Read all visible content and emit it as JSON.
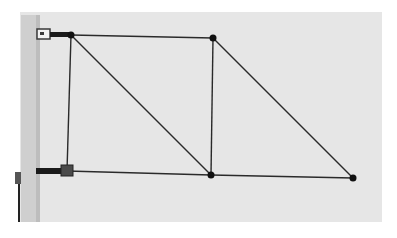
{
  "figure": {
    "colors": {
      "page": "#ffffff",
      "backdrop": "#e6e6e6",
      "post": "#cfcfcf",
      "post_shadow": "#bdbdbd",
      "member": "#2a2a2a",
      "joint": "#111111",
      "bracket": "#3a3a3a"
    },
    "backdrop": {
      "x": 20,
      "y": 12,
      "w": 362,
      "h": 210
    },
    "post": {
      "x": 21,
      "y": 15,
      "w": 19,
      "h": 207
    },
    "joints": [
      {
        "id": "A",
        "x": 71,
        "y": 35
      },
      {
        "id": "B",
        "x": 213,
        "y": 38
      },
      {
        "id": "C",
        "x": 67,
        "y": 171
      },
      {
        "id": "D",
        "x": 211,
        "y": 175
      },
      {
        "id": "E",
        "x": 353,
        "y": 178
      }
    ],
    "members": [
      {
        "from": "A",
        "to": "B"
      },
      {
        "from": "A",
        "to": "C"
      },
      {
        "from": "A",
        "to": "D"
      },
      {
        "from": "B",
        "to": "D"
      },
      {
        "from": "B",
        "to": "E"
      },
      {
        "from": "C",
        "to": "D"
      },
      {
        "from": "D",
        "to": "E"
      }
    ],
    "supports": [
      {
        "id": "top-support",
        "bracket_x": 42,
        "bracket_y": 33,
        "arm_to": "A"
      },
      {
        "id": "bottom-support",
        "bracket_x": 67,
        "bracket_y": 171,
        "arm_from_x": 36
      }
    ]
  }
}
